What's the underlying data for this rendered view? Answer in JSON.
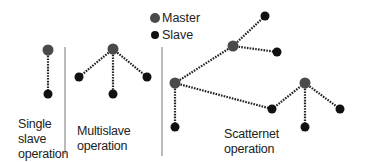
{
  "legend": {
    "master": {
      "label": "Master",
      "color": "#4a4a4a"
    },
    "slave": {
      "label": "Slave",
      "color": "#111111"
    }
  },
  "sections": [
    {
      "id": "single",
      "label_lines": [
        "Single",
        "slave",
        "operation"
      ]
    },
    {
      "id": "multi",
      "label_lines": [
        "Multislave",
        "operation"
      ]
    },
    {
      "id": "scatter",
      "label_lines": [
        "Scatternet",
        "operation"
      ]
    }
  ],
  "colors": {
    "link": "#222222",
    "divider": "#777777",
    "text": "#222222"
  },
  "nodes": [
    {
      "id": "s_m",
      "type": "master",
      "x": 48,
      "y": 50
    },
    {
      "id": "s_s",
      "type": "slave",
      "x": 48,
      "y": 94
    },
    {
      "id": "m_m",
      "type": "master",
      "x": 113,
      "y": 49
    },
    {
      "id": "m_s1",
      "type": "slave",
      "x": 79,
      "y": 77
    },
    {
      "id": "m_s2",
      "type": "slave",
      "x": 113,
      "y": 94
    },
    {
      "id": "m_s3",
      "type": "slave",
      "x": 147,
      "y": 77
    },
    {
      "id": "sc_mA",
      "type": "master",
      "x": 175,
      "y": 83
    },
    {
      "id": "sc_sA",
      "type": "slave",
      "x": 175,
      "y": 127
    },
    {
      "id": "sc_mB",
      "type": "master",
      "x": 233,
      "y": 46
    },
    {
      "id": "sc_sB1",
      "type": "slave",
      "x": 265,
      "y": 16
    },
    {
      "id": "sc_sB2",
      "type": "slave",
      "x": 277,
      "y": 52
    },
    {
      "id": "sc_bridge",
      "type": "slave",
      "x": 272,
      "y": 109
    },
    {
      "id": "sc_mC",
      "type": "master",
      "x": 305,
      "y": 83
    },
    {
      "id": "sc_sC1",
      "type": "slave",
      "x": 305,
      "y": 127
    },
    {
      "id": "sc_sC2",
      "type": "slave",
      "x": 340,
      "y": 109
    }
  ],
  "links": [
    [
      "s_m",
      "s_s"
    ],
    [
      "m_m",
      "m_s1"
    ],
    [
      "m_m",
      "m_s2"
    ],
    [
      "m_m",
      "m_s3"
    ],
    [
      "sc_mA",
      "sc_sA"
    ],
    [
      "sc_mA",
      "sc_mB"
    ],
    [
      "sc_mA",
      "sc_bridge"
    ],
    [
      "sc_mB",
      "sc_sB1"
    ],
    [
      "sc_mB",
      "sc_sB2"
    ],
    [
      "sc_bridge",
      "sc_mC"
    ],
    [
      "sc_mC",
      "sc_sC1"
    ],
    [
      "sc_mC",
      "sc_sC2"
    ]
  ]
}
